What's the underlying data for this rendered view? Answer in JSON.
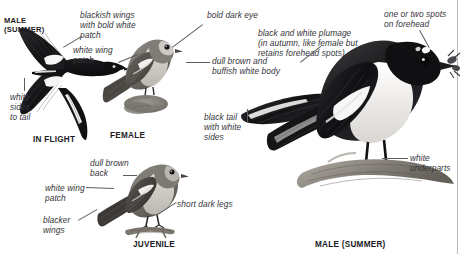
{
  "plate": {
    "subject": "Pied Flycatcher plate",
    "background_color": "#ffffff",
    "rule_color": "#b9b9b9"
  },
  "figures": [
    {
      "id": "in-flight",
      "caption": "IN FLIGHT",
      "corner_label": "MALE\n(SUMMER)",
      "plumage": "male summer, underwing view, black above with white wing patch and white sides to tail"
    },
    {
      "id": "female",
      "caption": "FEMALE",
      "plumage": "dull brown above, buffish white below, white wing patch"
    },
    {
      "id": "juvenile",
      "caption": "JUVENILE",
      "plumage": "dull brown back, white wing patch, blacker wings, short dark legs"
    },
    {
      "id": "male-summer",
      "caption": "MALE (SUMMER)",
      "plumage": "black and white plumage, white underparts, forehead spots, perched with insect prey"
    }
  ],
  "annotations": {
    "male_inflight_corner": "MALE\n(SUMMER)",
    "blackish_wings": "blackish wings\nwith bold white\npatch",
    "white_sides_to_tail": "white\nsides\nto tail",
    "white_wing_patch_female": "white wing\npatch",
    "bold_dark_eye": "bold dark eye",
    "dull_brown_buffish": "dull brown and\nbuffish white body",
    "black_tail_white_sides": "black tail\nwith white\nsides",
    "black_and_white_plumage": "black and white plumage\n(in autumn, like female but\nretains forehead spots)",
    "forehead_spots": "one or two spots\non forehead",
    "white_underparts": "white\nunderparts",
    "dull_brown_back": "dull brown\nback",
    "white_wing_patch_juv": "white wing\npatch",
    "blacker_wings": "blacker\nwings",
    "short_dark_legs": "short dark legs"
  },
  "captions": {
    "in_flight": "IN FLIGHT",
    "female": "FEMALE",
    "juvenile": "JUVENILE",
    "male_summer": "MALE (SUMMER)"
  }
}
